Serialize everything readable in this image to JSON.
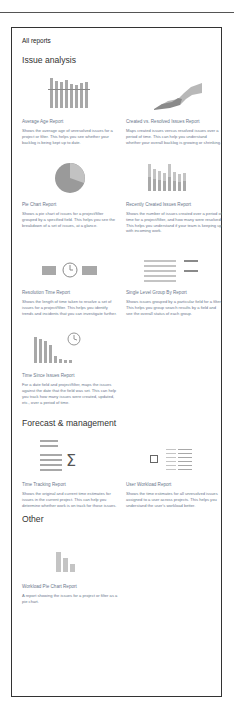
{
  "page": {
    "title": "All reports"
  },
  "sections": [
    {
      "title": "Issue analysis",
      "reports": [
        {
          "title": "Average Age Report",
          "icon": "bar-chart-icon",
          "description": "Shows the average age of unresolved issues for a project or filter. This helps you see whether your backlog is being kept up to date."
        },
        {
          "title": "Created vs. Resolved Issues Report",
          "icon": "area-chart-icon",
          "description": "Maps created issues versus resolved issues over a period of time. This can help you understand whether your overall backlog is growing or shrinking."
        },
        {
          "title": "Pie Chart Report",
          "icon": "pie-chart-icon",
          "description": "Shows a pie chart of issues for a project/filter grouped by a specified field. This helps you see the breakdown of a set of issues, at a glance."
        },
        {
          "title": "Recently Created Issues Report",
          "icon": "stacked-bar-chart-icon",
          "description": "Shows the number of issues created over a period of time for a project/filter, and how many were resolved. This helps you understand if your team is keeping up with incoming work."
        },
        {
          "title": "Resolution Time Report",
          "icon": "clock-timeline-icon",
          "description": "Shows the length of time taken to resolve a set of issues for a project/filter. This helps you identify trends and incidents that you can investigate further."
        },
        {
          "title": "Single Level Group By Report",
          "icon": "grouped-list-icon",
          "description": "Shows issues grouped by a particular field for a filter. This helps you group search results by a field and see the overall status of each group."
        },
        {
          "title": "Time Since Issues Report",
          "icon": "bar-clock-icon",
          "description": "For a date field and project/filter, maps the issues against the date that the field was set. This can help you track how many issues were created, updated, etc., over a period of time."
        }
      ]
    },
    {
      "title": "Forecast & management",
      "reports": [
        {
          "title": "Time Tracking Report",
          "icon": "sigma-list-icon",
          "description": "Shows the original and current time estimates for issues in the current project. This can help you determine whether work is on track for those issues."
        },
        {
          "title": "User Workload Report",
          "icon": "checklist-icon",
          "description": "Shows the time estimates for all unresolved issues assigned to a user across projects. This helps you understand the user's workload better."
        }
      ]
    },
    {
      "title": "Other",
      "reports": [
        {
          "title": "Workload Pie Chart Report",
          "icon": "small-bar-chart-icon",
          "description": "A report showing the issues for a project or filter as a pie chart."
        }
      ]
    }
  ]
}
